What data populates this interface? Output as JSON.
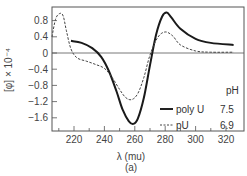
{
  "chart_data": {
    "type": "line",
    "title": "",
    "panel_label": "(a)",
    "xlabel": "λ (mu)",
    "ylabel": "[φ] × 10⁻⁴",
    "xlim": [
      205,
      325
    ],
    "ylim": [
      -1.9,
      1.05
    ],
    "x_ticks": [
      220,
      240,
      260,
      280,
      300,
      320
    ],
    "y_ticks": [
      0.8,
      0.4,
      0,
      -0.4,
      -0.8,
      -1.2,
      -1.6
    ],
    "x_tick_labels": [
      "220",
      "240",
      "260",
      "280",
      "300",
      "320"
    ],
    "y_tick_labels": [
      "0.8",
      "0.4",
      "0",
      "−0.4",
      "−0.8",
      "−1.2",
      "−1.6"
    ],
    "grid": false,
    "zero_line": true,
    "legend": {
      "position": "lower right",
      "header": "pH",
      "entries": [
        {
          "name": "poly U",
          "value": "7.5",
          "style": "solid"
        },
        {
          "name": "pU",
          "value": "6.9",
          "style": "dashed"
        }
      ]
    },
    "series": [
      {
        "name": "poly U",
        "style": "solid",
        "x": [
          218,
          225,
          232,
          238,
          243,
          248,
          252,
          256,
          259,
          262,
          266,
          270,
          274,
          278,
          281,
          284,
          290,
          300,
          310,
          325
        ],
        "y": [
          0.3,
          0.25,
          0.12,
          -0.1,
          -0.45,
          -0.95,
          -1.4,
          -1.68,
          -1.75,
          -1.62,
          -1.1,
          -0.3,
          0.45,
          0.9,
          1.0,
          0.88,
          0.6,
          0.35,
          0.25,
          0.2
        ]
      },
      {
        "name": "pU",
        "style": "dashed",
        "x": [
          205,
          208,
          211,
          213,
          215,
          218,
          222,
          228,
          234,
          240,
          245,
          250,
          254,
          258,
          262,
          266,
          270,
          275,
          280,
          285,
          290,
          300,
          310,
          325
        ],
        "y": [
          0.4,
          0.85,
          0.98,
          0.9,
          0.55,
          0.1,
          -0.12,
          -0.2,
          -0.28,
          -0.38,
          -0.6,
          -0.9,
          -1.1,
          -1.15,
          -1.0,
          -0.6,
          -0.05,
          0.38,
          0.52,
          0.42,
          0.2,
          0.05,
          0.02,
          0.02
        ]
      }
    ]
  }
}
